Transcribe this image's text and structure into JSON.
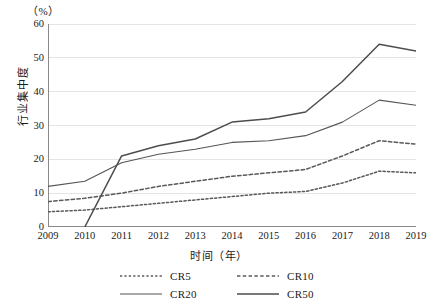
{
  "chart_data": {
    "type": "line",
    "title": "",
    "unit_label": "（%）",
    "xlabel": "时间（年）",
    "ylabel": "行业集中度",
    "x": [
      2009,
      2010,
      2011,
      2012,
      2013,
      2014,
      2015,
      2016,
      2017,
      2018,
      2019
    ],
    "categories": [
      "2009",
      "2010",
      "2011",
      "2012",
      "2013",
      "2014",
      "2015",
      "2016",
      "2017",
      "2018",
      "2019"
    ],
    "ylim": [
      0,
      60
    ],
    "yticks": [
      0,
      10,
      20,
      30,
      40,
      50,
      60
    ],
    "ytick_labels": [
      "0",
      "10",
      "20",
      "30",
      "40",
      "50",
      "60"
    ],
    "grid": "horizontal",
    "legend_position": "bottom",
    "series": [
      {
        "name": "CR5",
        "style": "dotted",
        "color": "#595959",
        "values": [
          4.5,
          5.0,
          6.0,
          7.0,
          8.0,
          9.0,
          10.0,
          10.5,
          13.0,
          16.5,
          16.0
        ]
      },
      {
        "name": "CR10",
        "style": "dashed",
        "color": "#595959",
        "values": [
          7.5,
          8.5,
          10.0,
          12.0,
          13.5,
          15.0,
          16.0,
          17.0,
          21.0,
          25.5,
          24.5
        ]
      },
      {
        "name": "CR20",
        "style": "solid-thin",
        "color": "#555555",
        "values": [
          12.0,
          13.5,
          19.0,
          21.5,
          23.0,
          25.0,
          25.5,
          27.0,
          31.0,
          37.5,
          36.0
        ]
      },
      {
        "name": "CR50",
        "style": "solid-thick",
        "color": "#4d4d4d",
        "values": [
          null,
          0.0,
          21.0,
          24.0,
          26.0,
          31.0,
          32.0,
          34.0,
          43.0,
          54.0,
          52.0
        ]
      }
    ]
  },
  "legend": {
    "items": [
      {
        "label": "CR5"
      },
      {
        "label": "CR10"
      },
      {
        "label": "CR20"
      },
      {
        "label": "CR50"
      }
    ]
  },
  "axes": {
    "unit": "（%）",
    "y_title": "行业集中度",
    "x_title": "时间（年）"
  },
  "colors": {
    "gridline": "#e4e4e4",
    "axis": "#8a8a8a",
    "line": "#555555",
    "text": "#1a1a1a",
    "background": "#ffffff"
  }
}
